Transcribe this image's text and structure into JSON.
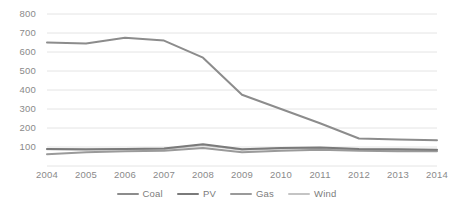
{
  "chart_data": {
    "type": "line",
    "title": "",
    "subtitle": "",
    "xlabel": "",
    "ylabel": "",
    "categories": [
      "2004",
      "2005",
      "2006",
      "2007",
      "2008",
      "2009",
      "2010",
      "2011",
      "2012",
      "2013",
      "2014"
    ],
    "x": [
      2004,
      2005,
      2006,
      2007,
      2008,
      2009,
      2010,
      2011,
      2012,
      2013,
      2014
    ],
    "ylim": [
      0,
      800
    ],
    "xlim": [
      2004,
      2014
    ],
    "yticks": [
      0,
      100,
      200,
      300,
      400,
      500,
      600,
      700,
      800
    ],
    "ytick_labels": [
      "",
      "100",
      "200",
      "300",
      "400",
      "500",
      "600",
      "700",
      "800"
    ],
    "grid": true,
    "grid_axis": "y",
    "legend_position": "bottom",
    "series": [
      {
        "name": "Coal",
        "color": "#8c8c8c",
        "values": [
          650,
          645,
          675,
          660,
          570,
          375,
          300,
          225,
          145,
          140,
          135
        ]
      },
      {
        "name": "PV",
        "color": "#7a7a7a",
        "values": [
          90,
          88,
          90,
          92,
          115,
          88,
          95,
          98,
          90,
          88,
          85
        ]
      },
      {
        "name": "Gas",
        "color": "#9a9a9a",
        "values": [
          62,
          72,
          78,
          80,
          95,
          72,
          80,
          85,
          80,
          78,
          78
        ]
      },
      {
        "name": "Wind",
        "color": "#c4c4c4",
        "values": [
          88,
          86,
          88,
          90,
          110,
          85,
          92,
          95,
          88,
          86,
          84
        ]
      }
    ]
  },
  "legend": {
    "items": [
      {
        "label": "Coal",
        "color": "#8c8c8c"
      },
      {
        "label": "PV",
        "color": "#7a7a7a"
      },
      {
        "label": "Gas",
        "color": "#9a9a9a"
      },
      {
        "label": "Wind",
        "color": "#c4c4c4"
      }
    ]
  },
  "axes": {
    "grid_color": "#e4e4e4",
    "tick_label_color": "#8a8a8a"
  }
}
